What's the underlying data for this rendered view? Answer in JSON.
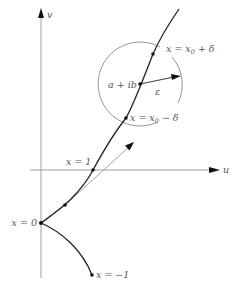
{
  "figure": {
    "axes": {
      "horizontal_label": "u",
      "vertical_label": "v"
    },
    "curve_labels": {
      "origin": "x = 0",
      "x_one": "x = 1",
      "x_minus_one": "x = −1",
      "x0_plus_delta_prefix": "x = x",
      "x0_plus_delta_sub": "0",
      "x0_plus_delta_suffix": " + δ",
      "x0_minus_delta_prefix": "x = x",
      "x0_minus_delta_sub": "0",
      "x0_minus_delta_suffix": " − δ",
      "center_point": "a + ib",
      "radius": "ε"
    },
    "colors": {
      "curve": "#222222",
      "axes": "#9a9a9a",
      "circle": "#8a8a8a",
      "tangent": "#999999",
      "text": "#555555"
    }
  }
}
